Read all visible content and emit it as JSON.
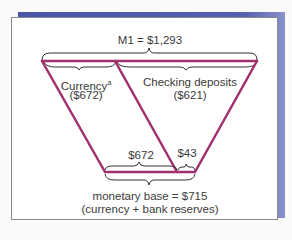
{
  "diagram": {
    "m1_label": "M1 = $1,293",
    "currency_label": "Currency",
    "currency_footnote": "a",
    "currency_value": "($672)",
    "checking_label": "Checking deposits",
    "checking_value": "($621)",
    "base_currency_value": "$672",
    "reserves_value": "$43",
    "monetary_base_label": "monetary base = $715",
    "monetary_base_note": "(currency + bank reserves)",
    "colors": {
      "line": "#a0306e",
      "bracket": "#333333",
      "shadow": "#4a55a8"
    }
  }
}
